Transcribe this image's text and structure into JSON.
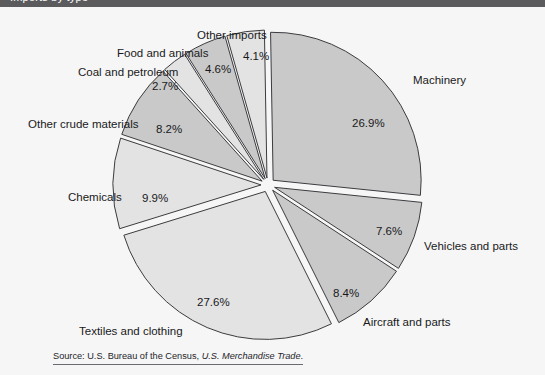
{
  "header": {
    "bar_text": "Imports by type",
    "bar_color": "#5b5b5e"
  },
  "source": {
    "prefix": "Source: U.S. Bureau of the Census,",
    "publication": "U.S. Merchandise Trade",
    "suffix": "."
  },
  "chart_data": {
    "type": "pie",
    "title": "",
    "legend_position": "callout-labels",
    "grid": false,
    "exploded": true,
    "units": "percent",
    "categories": [
      "Machinery",
      "Vehicles and parts",
      "Aircraft and parts",
      "Textiles and clothing",
      "Chemicals",
      "Other crude materials",
      "Coal and petroleum",
      "Food and animals",
      "Other imports"
    ],
    "values": [
      26.9,
      7.6,
      8.4,
      27.6,
      9.9,
      8.2,
      2.7,
      4.6,
      4.1
    ],
    "value_labels": [
      "26.9%",
      "7.6%",
      "8.4%",
      "27.6%",
      "9.9%",
      "8.2%",
      "2.7%",
      "4.6%",
      "4.1%"
    ],
    "slice_colors": [
      "#c9c9c9",
      "#c9c9c9",
      "#c9c9c9",
      "#e3e3e3",
      "#e3e3e3",
      "#c9c9c9",
      "#e3e3e3",
      "#c9c9c9",
      "#e3e3e3"
    ],
    "slices": [
      {
        "label": "Machinery",
        "value": 26.9,
        "value_label": "26.9%",
        "color": "#c9c9c9",
        "label_x": 413,
        "label_y": 68,
        "pct_x": 352,
        "pct_y": 111
      },
      {
        "label": "Vehicles and parts",
        "value": 7.6,
        "value_label": "7.6%",
        "color": "#c9c9c9",
        "label_x": 424,
        "label_y": 234,
        "pct_x": 376,
        "pct_y": 219
      },
      {
        "label": "Aircraft and parts",
        "value": 8.4,
        "value_label": "8.4%",
        "color": "#c9c9c9",
        "label_x": 363,
        "label_y": 310,
        "pct_x": 333,
        "pct_y": 281
      },
      {
        "label": "Textiles and clothing",
        "value": 27.6,
        "value_label": "27.6%",
        "color": "#e3e3e3",
        "label_x": 79,
        "label_y": 319,
        "pct_x": 197,
        "pct_y": 290
      },
      {
        "label": "Chemicals",
        "value": 9.9,
        "value_label": "9.9%",
        "color": "#e3e3e3",
        "label_x": 68,
        "label_y": 185,
        "pct_x": 142,
        "pct_y": 186
      },
      {
        "label": "Other crude materials",
        "value": 8.2,
        "value_label": "8.2%",
        "color": "#c9c9c9",
        "label_x": 28,
        "label_y": 112,
        "pct_x": 156,
        "pct_y": 117
      },
      {
        "label": "Coal and petroleum",
        "value": 2.7,
        "value_label": "2.7%",
        "color": "#e3e3e3",
        "label_x": 78,
        "label_y": 60,
        "pct_x": 152,
        "pct_y": 74
      },
      {
        "label": "Food and animals",
        "value": 4.6,
        "value_label": "4.6%",
        "color": "#c9c9c9",
        "label_x": 117,
        "label_y": 41,
        "pct_x": 205,
        "pct_y": 57
      },
      {
        "label": "Other imports",
        "value": 4.1,
        "value_label": "4.1%",
        "color": "#e3e3e3",
        "label_x": 197,
        "label_y": 23,
        "pct_x": 243,
        "pct_y": 44
      }
    ]
  }
}
